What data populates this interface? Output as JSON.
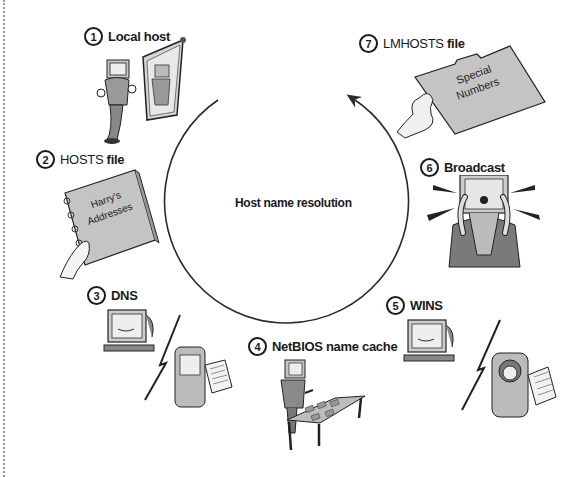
{
  "diagram": {
    "title": "Host name resolution",
    "type": "cycle",
    "steps": [
      {
        "number": "1",
        "label": "Local host",
        "label_suffix": "",
        "illustration": "computer-person-looking-in-mirror"
      },
      {
        "number": "2",
        "label": "HOSTS",
        "label_suffix": "file",
        "illustration": "hand-holding-address-book",
        "book_text": "Harry's Addresses"
      },
      {
        "number": "3",
        "label": "DNS",
        "label_suffix": "",
        "illustration": "computer-calling-server-with-list"
      },
      {
        "number": "4",
        "label": "NetBIOS name cache",
        "label_suffix": "",
        "illustration": "computer-person-at-table-with-cards"
      },
      {
        "number": "5",
        "label": "WINS",
        "label_suffix": "",
        "illustration": "computer-calling-server-with-headset"
      },
      {
        "number": "6",
        "label": "Broadcast",
        "label_suffix": "",
        "illustration": "computer-person-shouting"
      },
      {
        "number": "7",
        "label": "LMHOSTS",
        "label_suffix": "file",
        "illustration": "hand-holding-folder",
        "folder_text": "Special Numbers"
      }
    ]
  },
  "colors": {
    "line": "#2a2a2a",
    "fill_gray": "#b8b8b8",
    "fill_dark": "#6a6a6a",
    "border_dotted": "#9a9a9a",
    "background": "#ffffff"
  }
}
